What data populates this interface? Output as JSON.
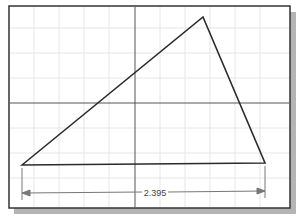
{
  "drawing": {
    "dimension_label": "2.395",
    "colors": {
      "line": "#2a2a2a",
      "grid": "#e2e2e2",
      "axis": "#555555",
      "shadow": "#b4b4b4",
      "dim": "#777777"
    },
    "triangle": [
      [
        22,
        165
      ],
      [
        203,
        17
      ],
      [
        265,
        163
      ]
    ]
  }
}
